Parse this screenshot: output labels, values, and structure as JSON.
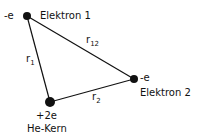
{
  "diagram": {
    "colors": {
      "ink": "#111111",
      "background": "#ffffff"
    },
    "nodes": [
      {
        "id": "electron1",
        "charge": "-e",
        "label": "Elektron 1",
        "x": 27,
        "y": 16,
        "r": 4
      },
      {
        "id": "electron2",
        "charge": "-e",
        "label": "Elektron 2",
        "x": 134,
        "y": 79,
        "r": 4
      },
      {
        "id": "nucleus",
        "charge": "+2e",
        "label": "He-Kern",
        "x": 50,
        "y": 102,
        "r": 5
      }
    ],
    "edges": [
      {
        "from": "electron1",
        "to": "nucleus",
        "label_base": "r",
        "label_sub": "1"
      },
      {
        "from": "electron1",
        "to": "electron2",
        "label_base": "r",
        "label_sub": "12"
      },
      {
        "from": "nucleus",
        "to": "electron2",
        "label_base": "r",
        "label_sub": "2"
      }
    ]
  }
}
